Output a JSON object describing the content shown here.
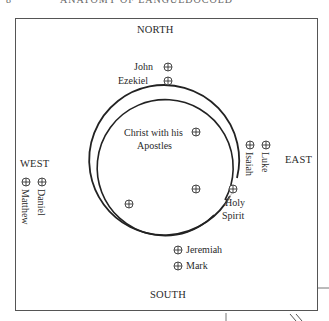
{
  "page": {
    "page_number": "8",
    "running_header": "ANATOMY OF LANGUEDOCOLD"
  },
  "diagram": {
    "directions": {
      "north": "NORTH",
      "south": "SOUTH",
      "east": "EAST",
      "west": "WEST"
    },
    "center_label_line1": "Christ with his",
    "center_label_line2": "Apostles",
    "holy_spirit_line1": "Holy",
    "holy_spirit_line2": "Spirit",
    "figures": {
      "north": [
        "John",
        "Ezekiel"
      ],
      "east": [
        "Isaiah",
        "Luke"
      ],
      "west": [
        "Matthew",
        "Daniel"
      ],
      "south": [
        "Jeremiah",
        "Mark"
      ]
    },
    "marker_symbol": "circled-cross",
    "colors": {
      "ink": "#2a2a2a",
      "frame": "#555555",
      "background": "#ffffff"
    }
  }
}
